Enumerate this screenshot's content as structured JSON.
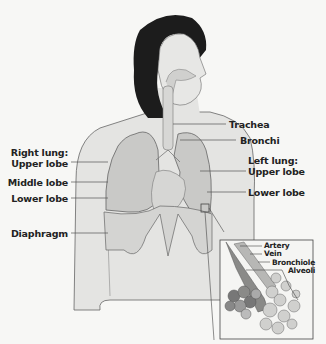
{
  "figure": {
    "labels_left": {
      "right_lung_heading": "Right lung:",
      "upper_lobe": "Upper lobe",
      "middle_lobe": "Middle lobe",
      "lower_lobe": "Lower lobe",
      "diaphragm": "Diaphragm"
    },
    "labels_right": {
      "trachea": "Trachea",
      "bronchi": "Bronchi",
      "left_lung_heading": "Left lung:",
      "upper_lobe": "Upper lobe",
      "lower_lobe": "Lower lobe"
    },
    "inset_labels": {
      "artery": "Artery",
      "vein": "Vein",
      "bronchiole": "Bronchiole",
      "alveoli": "Alveoli"
    },
    "colors": {
      "background": "#f7f7f5",
      "skin": "#e4e4e2",
      "lung": "#c9c9c7",
      "hair": "#1c1c1c",
      "outline": "#666666",
      "alveoli_dark": "#777777",
      "alveoli_light": "#cfcfcd"
    }
  }
}
